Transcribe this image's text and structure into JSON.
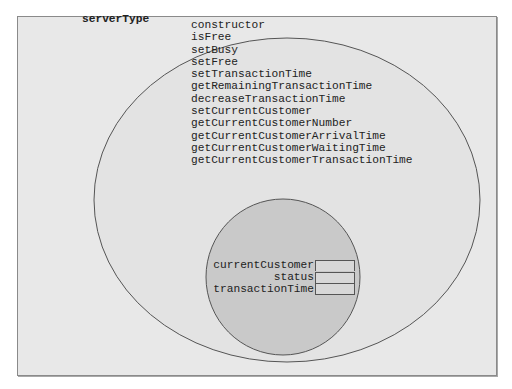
{
  "diagram": {
    "class_name": "serverType",
    "methods": [
      "constructor",
      "isFree",
      "setBusy",
      "setFree",
      "setTransactionTime",
      "getRemainingTransactionTime",
      "decreaseTransactionTime",
      "setCurrentCustomer",
      "getCurrentCustomerNumber",
      "getCurrentCustomerArrivalTime",
      "getCurrentCustomerWaitingTime",
      "getCurrentCustomerTransactionTime"
    ],
    "fields": [
      {
        "name": "currentCustomer",
        "value": ""
      },
      {
        "name": "status",
        "value": ""
      },
      {
        "name": "transactionTime",
        "value": ""
      }
    ],
    "colors": {
      "background": "#e8e8e8",
      "outer_ellipse_fill": "#e3e3e3",
      "inner_circle_fill": "#c9c9c9",
      "stroke": "#555555"
    }
  }
}
